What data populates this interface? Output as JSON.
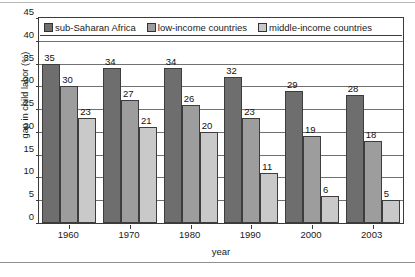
{
  "chart_data": {
    "type": "bar",
    "title": "",
    "xlabel": "year",
    "ylabel": "gap in child labor (%)",
    "categories": [
      "1960",
      "1970",
      "1980",
      "1990",
      "2000",
      "2003"
    ],
    "ylim": [
      0,
      45
    ],
    "yticks": [
      0,
      5,
      10,
      15,
      20,
      25,
      30,
      35,
      40,
      45
    ],
    "grid": true,
    "legend_position": "top-inside",
    "series": [
      {
        "name": "sub-Saharan Africa",
        "color": "#6e6e6e",
        "values": [
          35,
          34,
          34,
          32,
          29,
          28
        ]
      },
      {
        "name": "low-income countries",
        "color": "#9d9d9d",
        "values": [
          30,
          27,
          26,
          23,
          19,
          18
        ]
      },
      {
        "name": "middle-income countries",
        "color": "#c9c9c9",
        "values": [
          23,
          21,
          20,
          11,
          6,
          5
        ]
      }
    ]
  }
}
